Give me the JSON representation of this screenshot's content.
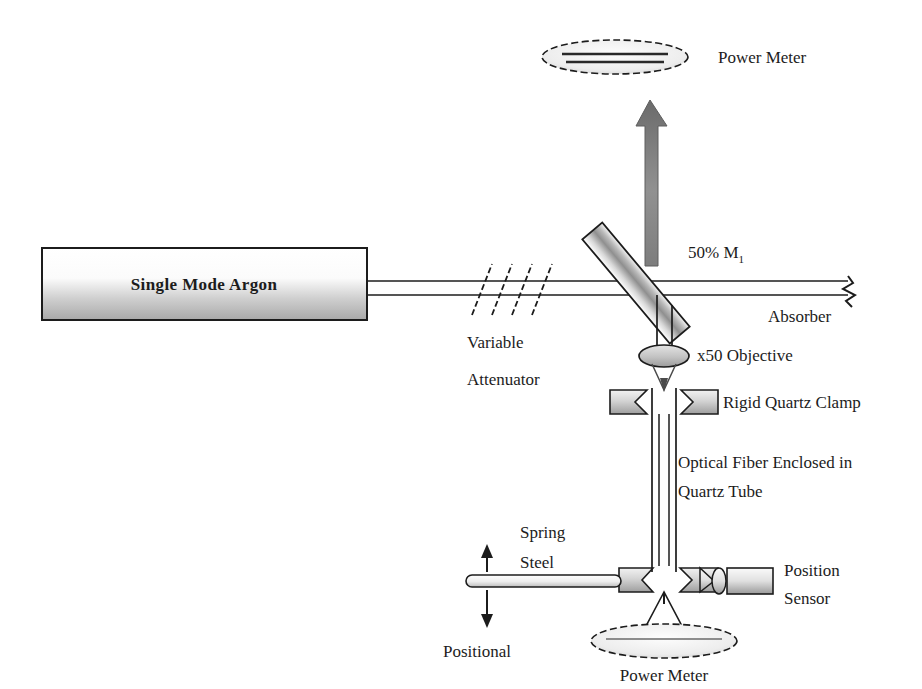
{
  "figure": {
    "type": "optical-setup-diagram",
    "background": "#ffffff",
    "ink_color": "#1c1c1c"
  },
  "labels": {
    "power_meter_top": "Power Meter",
    "power_meter_bottom": "Power Meter",
    "laser_source": "Single Mode Argon",
    "variable": "Variable",
    "attenuator": "Attenuator",
    "beamsplitter": "50% M",
    "beamsplitter_sub": "1",
    "absorber": "Absorber",
    "objective": "x50 Objective",
    "clamp": "Rigid Quartz Clamp",
    "fiber_line1": "Optical Fiber Enclosed in",
    "fiber_line2": "Quartz Tube",
    "spring_line1": "Spring",
    "spring_line2": "Steel",
    "positional": "Positional",
    "position_sensor_line1": "Position",
    "position_sensor_line2": "Sensor"
  },
  "colors": {
    "stroke": "#1c1c1c",
    "beam_gray": "#8c8c8c",
    "fill_light": "#e8e8e8",
    "fill_mid": "#b4b4b4",
    "fill_dark": "#6e6e6e"
  },
  "components": [
    {
      "name": "power-meter-top",
      "shape": "ellipse",
      "cx": 615,
      "cy": 57
    },
    {
      "name": "laser-source-box",
      "shape": "rect",
      "x": 42,
      "y": 248,
      "w": 325,
      "h": 72
    },
    {
      "name": "variable-attenuator",
      "shape": "hatch-lines",
      "x": 466,
      "y": 288
    },
    {
      "name": "beamsplitter-mirror",
      "shape": "rotated-rect",
      "cx": 651,
      "cy": 283,
      "angle": 45
    },
    {
      "name": "absorber",
      "shape": "zigzag",
      "x": 848,
      "y": 288
    },
    {
      "name": "objective-lens",
      "shape": "ellipse",
      "cx": 664,
      "cy": 356
    },
    {
      "name": "rigid-quartz-clamp",
      "shape": "clamp-pair",
      "cx": 664,
      "cy": 402
    },
    {
      "name": "optical-fiber-tube",
      "shape": "vertical-tube",
      "cx": 664,
      "y1": 414,
      "y2": 566
    },
    {
      "name": "lower-clamp",
      "shape": "clamp-pair",
      "cx": 664,
      "cy": 580
    },
    {
      "name": "spring-steel-rod",
      "shape": "rod",
      "x1": 466,
      "x2": 620,
      "y": 581
    },
    {
      "name": "positional-arrow",
      "shape": "double-arrow",
      "x": 487,
      "y1": 545,
      "y2": 628
    },
    {
      "name": "position-sensor",
      "shape": "sensor-body",
      "x": 700,
      "y": 568
    },
    {
      "name": "power-meter-bottom",
      "shape": "ellipse",
      "cx": 664,
      "cy": 641
    }
  ]
}
